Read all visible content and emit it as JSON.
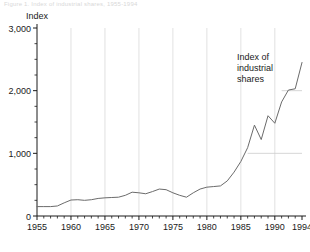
{
  "figure": {
    "cropped_header": "Figure 1. Index of industrial shares, 1955-1994",
    "axis_unit_label": "Index",
    "annotation": {
      "lines": [
        "Index of",
        "industrial",
        "shares"
      ]
    }
  },
  "chart_data": {
    "type": "line",
    "title": "",
    "xlabel": "",
    "ylabel": "Index",
    "xlim": [
      1955,
      1994
    ],
    "ylim": [
      0,
      3000
    ],
    "grid": "partial",
    "legend": "none",
    "line_color": "#6b6b6b",
    "gridline_color": "#cccccc",
    "axis_color": "#1a1a1a",
    "y_ticks_major": [
      0,
      1000,
      2000,
      3000
    ],
    "y_tick_labels": [
      "0",
      "1,000",
      "2,000",
      "3,000"
    ],
    "y_tick_minor_step": 250,
    "x_ticks_major": [
      1955,
      1960,
      1965,
      1970,
      1975,
      1980,
      1985,
      1990,
      1994
    ],
    "x_tick_labels": [
      "1955",
      "1960",
      "1965",
      "1970",
      "1975",
      "1980",
      "1985",
      "1990",
      "1994"
    ],
    "x_tick_minor_step": 1,
    "partial_gridlines_horizontal": [
      {
        "value": 1000,
        "x_start": 1986,
        "x_end": 1994
      },
      {
        "value": 2000,
        "x_start": 1991,
        "x_end": 1994
      }
    ],
    "vertical_gridlines": [
      1960,
      1965,
      1970,
      1975,
      1980,
      1985,
      1990
    ],
    "annotation_text": "Index of industrial shares",
    "series": [
      {
        "name": "Index of industrial shares",
        "x": [
          1955,
          1956,
          1957,
          1958,
          1959,
          1960,
          1961,
          1962,
          1963,
          1964,
          1965,
          1966,
          1967,
          1968,
          1969,
          1970,
          1971,
          1972,
          1973,
          1974,
          1975,
          1976,
          1977,
          1978,
          1979,
          1980,
          1981,
          1982,
          1983,
          1984,
          1985,
          1986,
          1987,
          1988,
          1989,
          1990,
          1991,
          1992,
          1993,
          1994
        ],
        "values": [
          150,
          150,
          150,
          160,
          210,
          255,
          260,
          250,
          260,
          280,
          290,
          295,
          300,
          330,
          380,
          370,
          355,
          390,
          430,
          420,
          370,
          330,
          300,
          370,
          430,
          460,
          470,
          480,
          560,
          700,
          870,
          1090,
          1450,
          1220,
          1600,
          1480,
          1820,
          2010,
          2030,
          2450
        ]
      }
    ]
  }
}
